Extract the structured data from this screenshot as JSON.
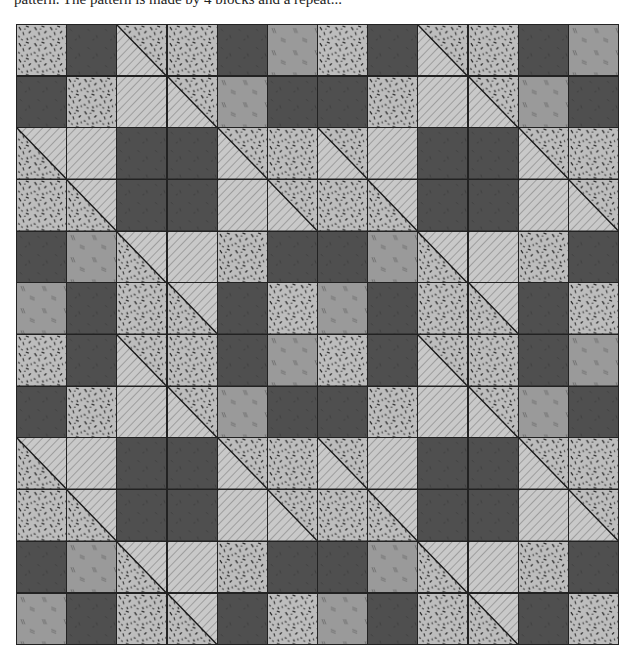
{
  "caption": "pattern. The pattern is made by 4 blocks and a repeat...",
  "quilt": {
    "rows": 12,
    "cols": 12,
    "legend": {
      "S": "speckled light fabric",
      "D": "dark solid fabric",
      "M": "medium gray fabric with double-line marks",
      "H": "light diagonal-striped fabric",
      "TS": "half-square triangle: hatched lower-left, speckled upper-right",
      "TH": "half-square triangle: speckled lower-left, hatched upper-right"
    },
    "colors": {
      "speckle_bg": "#bdbdbd",
      "speckle_fleck": "#1e1e1e",
      "dark": "#4f4f4f",
      "medium": "#9a9a9a",
      "hatch_bg": "#c9c9c9",
      "hatch_line": "#8a8a8a",
      "seam": "#222222"
    },
    "grid": [
      [
        "S",
        "D",
        "TS",
        "S",
        "D",
        "M",
        "S",
        "D",
        "TS",
        "S",
        "D",
        "M"
      ],
      [
        "D",
        "S",
        "H",
        "TS",
        "M",
        "D",
        "D",
        "S",
        "H",
        "TS",
        "M",
        "D"
      ],
      [
        "TH",
        "H",
        "D",
        "D",
        "TS",
        "S",
        "TS",
        "H",
        "D",
        "D",
        "TS",
        "S"
      ],
      [
        "S",
        "TH",
        "D",
        "D",
        "H",
        "TS",
        "S",
        "TH",
        "D",
        "D",
        "H",
        "TS"
      ],
      [
        "D",
        "M",
        "TH",
        "H",
        "S",
        "D",
        "D",
        "M",
        "TH",
        "H",
        "S",
        "D"
      ],
      [
        "M",
        "D",
        "S",
        "TH",
        "D",
        "S",
        "M",
        "D",
        "S",
        "TH",
        "D",
        "S"
      ],
      [
        "S",
        "D",
        "TS",
        "S",
        "D",
        "M",
        "S",
        "D",
        "TS",
        "S",
        "D",
        "M"
      ],
      [
        "D",
        "S",
        "H",
        "TS",
        "M",
        "D",
        "D",
        "S",
        "H",
        "TS",
        "M",
        "D"
      ],
      [
        "TH",
        "H",
        "D",
        "D",
        "TS",
        "S",
        "TS",
        "H",
        "D",
        "D",
        "TS",
        "S"
      ],
      [
        "S",
        "TH",
        "D",
        "D",
        "H",
        "TS",
        "S",
        "TH",
        "D",
        "D",
        "H",
        "TS"
      ],
      [
        "D",
        "M",
        "TH",
        "H",
        "S",
        "D",
        "D",
        "M",
        "TH",
        "H",
        "S",
        "D"
      ],
      [
        "M",
        "D",
        "S",
        "TH",
        "D",
        "S",
        "M",
        "D",
        "S",
        "TH",
        "D",
        "S"
      ]
    ]
  }
}
